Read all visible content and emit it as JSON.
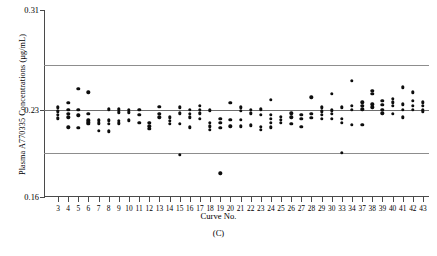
{
  "chart_data": {
    "type": "scatter",
    "title": "",
    "panel_label": "(C)",
    "xlabel": "Curve No.",
    "ylabel": "Plasma A770335 Concentrations (µg/mL)",
    "ylim": [
      0.16,
      0.31
    ],
    "ytick_labels": [
      "0.16",
      "0.23",
      "0.31"
    ],
    "ytick_values": [
      0.16,
      0.23,
      0.31
    ],
    "grid": false,
    "legend": null,
    "xlim_categories": [
      3,
      4,
      5,
      6,
      7,
      8,
      9,
      10,
      11,
      12,
      13,
      14,
      15,
      16,
      17,
      18,
      19,
      20,
      21,
      22,
      23,
      24,
      25,
      26,
      27,
      28,
      29,
      30,
      33,
      34,
      37,
      38,
      39,
      40,
      41,
      42,
      43
    ],
    "xtick_labels": [
      "3",
      "4",
      "5",
      "6",
      "7",
      "8",
      "9",
      "10",
      "11",
      "12",
      "13",
      "14",
      "15",
      "16",
      "17",
      "18",
      "19",
      "20",
      "21",
      "22",
      "23",
      "24",
      "25",
      "26",
      "27",
      "28",
      "29",
      "30",
      "33",
      "34",
      "37",
      "38",
      "39",
      "40",
      "41",
      "42",
      "43"
    ],
    "reference_lines": [
      {
        "name": "upper-control-limit",
        "value": 0.2655,
        "color": "#8d8d8d"
      },
      {
        "name": "center-line",
        "value": 0.23,
        "color": "#6d6d6d"
      },
      {
        "name": "lower-control-limit",
        "value": 0.1955,
        "color": "#8d8d8d"
      }
    ],
    "series": [
      {
        "name": "Plasma A770335 concentration",
        "color": "#0d0d0d",
        "points": [
          {
            "x": 3,
            "y": 0.2318
          },
          {
            "x": 3,
            "y": 0.2288
          },
          {
            "x": 3,
            "y": 0.2258
          },
          {
            "x": 3,
            "y": 0.223
          },
          {
            "x": 4,
            "y": 0.2355
          },
          {
            "x": 4,
            "y": 0.23
          },
          {
            "x": 4,
            "y": 0.2268
          },
          {
            "x": 4,
            "y": 0.2238
          },
          {
            "x": 4,
            "y": 0.216
          },
          {
            "x": 5,
            "y": 0.247
          },
          {
            "x": 5,
            "y": 0.23
          },
          {
            "x": 5,
            "y": 0.2255
          },
          {
            "x": 5,
            "y": 0.2155
          },
          {
            "x": 6,
            "y": 0.244
          },
          {
            "x": 6,
            "y": 0.2268
          },
          {
            "x": 6,
            "y": 0.2215
          },
          {
            "x": 6,
            "y": 0.22
          },
          {
            "x": 6,
            "y": 0.2188
          },
          {
            "x": 7,
            "y": 0.2215
          },
          {
            "x": 7,
            "y": 0.219
          },
          {
            "x": 7,
            "y": 0.213
          },
          {
            "x": 8,
            "y": 0.2305
          },
          {
            "x": 8,
            "y": 0.2215
          },
          {
            "x": 8,
            "y": 0.2185
          },
          {
            "x": 8,
            "y": 0.2128
          },
          {
            "x": 9,
            "y": 0.2305
          },
          {
            "x": 9,
            "y": 0.228
          },
          {
            "x": 9,
            "y": 0.221
          },
          {
            "x": 9,
            "y": 0.219
          },
          {
            "x": 10,
            "y": 0.23
          },
          {
            "x": 10,
            "y": 0.228
          },
          {
            "x": 10,
            "y": 0.2215
          },
          {
            "x": 11,
            "y": 0.23
          },
          {
            "x": 11,
            "y": 0.2258
          },
          {
            "x": 11,
            "y": 0.2195
          },
          {
            "x": 12,
            "y": 0.2195
          },
          {
            "x": 12,
            "y": 0.2168
          },
          {
            "x": 12,
            "y": 0.2148
          },
          {
            "x": 13,
            "y": 0.2325
          },
          {
            "x": 13,
            "y": 0.2268
          },
          {
            "x": 13,
            "y": 0.2238
          },
          {
            "x": 14,
            "y": 0.224
          },
          {
            "x": 14,
            "y": 0.221
          },
          {
            "x": 14,
            "y": 0.2188
          },
          {
            "x": 15,
            "y": 0.2318
          },
          {
            "x": 15,
            "y": 0.227
          },
          {
            "x": 15,
            "y": 0.2188
          },
          {
            "x": 15,
            "y": 0.1938
          },
          {
            "x": 16,
            "y": 0.23
          },
          {
            "x": 16,
            "y": 0.2268
          },
          {
            "x": 16,
            "y": 0.2238
          },
          {
            "x": 16,
            "y": 0.216
          },
          {
            "x": 17,
            "y": 0.233
          },
          {
            "x": 17,
            "y": 0.23
          },
          {
            "x": 17,
            "y": 0.227
          },
          {
            "x": 17,
            "y": 0.2228
          },
          {
            "x": 18,
            "y": 0.2295
          },
          {
            "x": 18,
            "y": 0.2195
          },
          {
            "x": 18,
            "y": 0.2168
          },
          {
            "x": 18,
            "y": 0.214
          },
          {
            "x": 19,
            "y": 0.2228
          },
          {
            "x": 19,
            "y": 0.2195
          },
          {
            "x": 19,
            "y": 0.2155
          },
          {
            "x": 19,
            "y": 0.179
          },
          {
            "x": 20,
            "y": 0.2355
          },
          {
            "x": 20,
            "y": 0.2218
          },
          {
            "x": 20,
            "y": 0.2168
          },
          {
            "x": 21,
            "y": 0.2318
          },
          {
            "x": 21,
            "y": 0.229
          },
          {
            "x": 21,
            "y": 0.2218
          },
          {
            "x": 21,
            "y": 0.2168
          },
          {
            "x": 22,
            "y": 0.23
          },
          {
            "x": 22,
            "y": 0.227
          },
          {
            "x": 22,
            "y": 0.2175
          },
          {
            "x": 23,
            "y": 0.2305
          },
          {
            "x": 23,
            "y": 0.2258
          },
          {
            "x": 23,
            "y": 0.2165
          },
          {
            "x": 23,
            "y": 0.214
          },
          {
            "x": 24,
            "y": 0.238
          },
          {
            "x": 24,
            "y": 0.2258
          },
          {
            "x": 24,
            "y": 0.2225
          },
          {
            "x": 24,
            "y": 0.2195
          },
          {
            "x": 24,
            "y": 0.2158
          },
          {
            "x": 25,
            "y": 0.2245
          },
          {
            "x": 25,
            "y": 0.2218
          },
          {
            "x": 25,
            "y": 0.2195
          },
          {
            "x": 26,
            "y": 0.227
          },
          {
            "x": 26,
            "y": 0.2238
          },
          {
            "x": 26,
            "y": 0.2185
          },
          {
            "x": 27,
            "y": 0.2258
          },
          {
            "x": 27,
            "y": 0.2228
          },
          {
            "x": 27,
            "y": 0.2165
          },
          {
            "x": 28,
            "y": 0.24
          },
          {
            "x": 28,
            "y": 0.2268
          },
          {
            "x": 28,
            "y": 0.2235
          },
          {
            "x": 29,
            "y": 0.2318
          },
          {
            "x": 29,
            "y": 0.2288
          },
          {
            "x": 29,
            "y": 0.2258
          },
          {
            "x": 29,
            "y": 0.2225
          },
          {
            "x": 30,
            "y": 0.243
          },
          {
            "x": 30,
            "y": 0.2295
          },
          {
            "x": 30,
            "y": 0.2265
          },
          {
            "x": 30,
            "y": 0.2228
          },
          {
            "x": 33,
            "y": 0.2318
          },
          {
            "x": 33,
            "y": 0.2225
          },
          {
            "x": 33,
            "y": 0.2195
          },
          {
            "x": 33,
            "y": 0.1955
          },
          {
            "x": 34,
            "y": 0.253
          },
          {
            "x": 34,
            "y": 0.233
          },
          {
            "x": 34,
            "y": 0.23
          },
          {
            "x": 34,
            "y": 0.218
          },
          {
            "x": 37,
            "y": 0.236
          },
          {
            "x": 37,
            "y": 0.233
          },
          {
            "x": 37,
            "y": 0.2305
          },
          {
            "x": 37,
            "y": 0.218
          },
          {
            "x": 38,
            "y": 0.245
          },
          {
            "x": 38,
            "y": 0.243
          },
          {
            "x": 38,
            "y": 0.2345
          },
          {
            "x": 38,
            "y": 0.232
          },
          {
            "x": 39,
            "y": 0.237
          },
          {
            "x": 39,
            "y": 0.234
          },
          {
            "x": 39,
            "y": 0.23
          },
          {
            "x": 39,
            "y": 0.227
          },
          {
            "x": 40,
            "y": 0.239
          },
          {
            "x": 40,
            "y": 0.236
          },
          {
            "x": 40,
            "y": 0.233
          },
          {
            "x": 40,
            "y": 0.2268
          },
          {
            "x": 41,
            "y": 0.248
          },
          {
            "x": 41,
            "y": 0.2345
          },
          {
            "x": 41,
            "y": 0.23
          },
          {
            "x": 41,
            "y": 0.224
          },
          {
            "x": 42,
            "y": 0.244
          },
          {
            "x": 42,
            "y": 0.237
          },
          {
            "x": 42,
            "y": 0.233
          },
          {
            "x": 42,
            "y": 0.23
          },
          {
            "x": 43,
            "y": 0.236
          },
          {
            "x": 43,
            "y": 0.233
          },
          {
            "x": 43,
            "y": 0.23
          },
          {
            "x": 43,
            "y": 0.2288
          }
        ]
      }
    ]
  }
}
